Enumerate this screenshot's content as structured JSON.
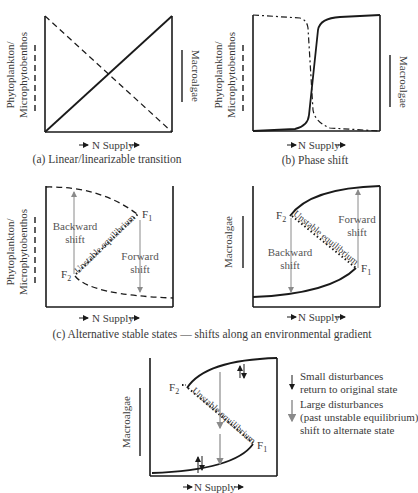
{
  "panels": {
    "a": {
      "caption": "(a) Linear/linearizable transition",
      "xlabel": "N Supply",
      "ylabel_left_1": "Phytoplankton/",
      "ylabel_left_2": "Microphytobenthos",
      "ylabel_right": "Macroalgae"
    },
    "b": {
      "caption": "(b) Phase shift",
      "xlabel": "N Supply",
      "ylabel_left_1": "Phytoplankton/",
      "ylabel_left_2": "Microphytobenthos",
      "ylabel_right": "Macroalgae"
    },
    "c_left": {
      "xlabel": "N Supply",
      "ylabel_1": "Phytoplankton/",
      "ylabel_2": "Microphytobenthos",
      "backward_1": "Backward",
      "backward_2": "shift",
      "forward_1": "Forward",
      "forward_2": "shift",
      "unstable": "Unstable equilibrium",
      "f1": "F",
      "f1_sub": "1",
      "f2": "F",
      "f2_sub": "2"
    },
    "c_right": {
      "xlabel": "N Supply",
      "ylabel": "Macroalgae",
      "backward_1": "Backward",
      "backward_2": "shift",
      "forward_1": "Forward",
      "forward_2": "shift",
      "unstable": "Unstable equilibrium",
      "f1": "F",
      "f1_sub": "1",
      "f2": "F",
      "f2_sub": "2"
    },
    "c_caption": "(c) Alternative stable states — shifts along an environmental gradient",
    "d": {
      "xlabel": "N Supply",
      "ylabel": "Macroalgae",
      "unstable": "Unstable equilibrium",
      "f1": "F",
      "f1_sub": "1",
      "f2": "F",
      "f2_sub": "2",
      "legend": {
        "small_1": "Small disturbances",
        "small_2": "return to original state",
        "large_1": "Large disturbances",
        "large_2": "(past unstable equilibrium)",
        "large_3": "shift to alternate state"
      }
    }
  },
  "colors": {
    "line": "#1a1a1a",
    "gray_arrow": "#8a8a8a",
    "text": "#3a3a3a"
  }
}
